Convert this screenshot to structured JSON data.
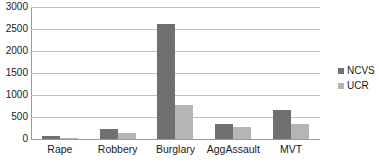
{
  "chart_data": {
    "type": "bar",
    "title": "",
    "subtitle": "",
    "xlabel": "",
    "ylabel": "",
    "categories": [
      "Rape",
      "Robbery",
      "Burglary",
      "AggAssault",
      "MVT"
    ],
    "series": [
      {
        "name": "NCVS",
        "color": "#707070",
        "values": [
          70,
          225,
          2620,
          330,
          660
        ]
      },
      {
        "name": "UCR",
        "color": "#b5b5b5",
        "values": [
          25,
          145,
          775,
          280,
          330
        ]
      }
    ],
    "ylim": [
      0,
      3000
    ],
    "ytick_values": [
      0,
      500,
      1000,
      1500,
      2000,
      2500,
      3000
    ],
    "ytick_labels": [
      "0",
      "500",
      "1000",
      "1500",
      "2000",
      "2500",
      "3000"
    ],
    "grid": true,
    "grid_axis": "y",
    "legend_position": "right",
    "legend_entries": [
      "NCVS",
      "UCR"
    ],
    "axis_color": "#9a9a9a",
    "gridline_color": "#bfbfbf",
    "background": "#ffffff"
  }
}
